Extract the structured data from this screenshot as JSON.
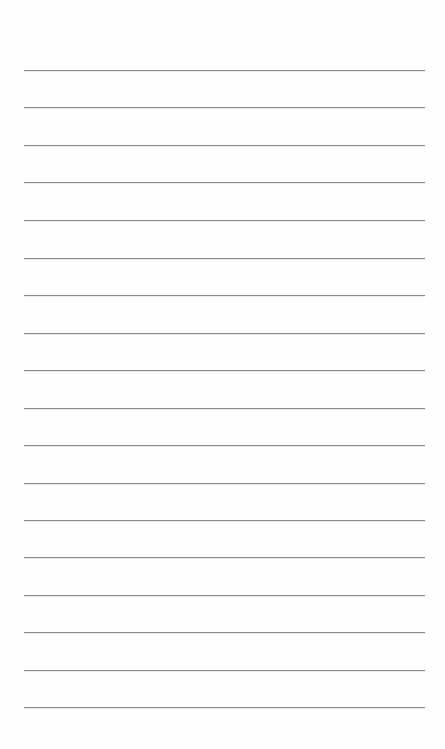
{
  "page": {
    "type": "lined-paper",
    "background_color": "#fefefe",
    "line_color": "#8c8c8c",
    "line_count": 18,
    "line_left_px": 24,
    "line_right_px": 425,
    "lines_y_px": [
      70,
      107,
      145,
      182,
      220,
      258,
      295,
      333,
      370,
      408,
      445,
      483,
      520,
      557,
      595,
      632,
      670,
      707
    ]
  }
}
